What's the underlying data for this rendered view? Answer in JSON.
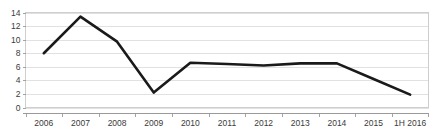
{
  "chart_data": {
    "type": "line",
    "title": "",
    "subtitle": "",
    "xlabel": "",
    "ylabel": "",
    "categories": [
      "2006",
      "2007",
      "2008",
      "2009",
      "2010",
      "2011",
      "2012",
      "2013",
      "2014",
      "2015",
      "1H 2016"
    ],
    "values": [
      8.0,
      13.4,
      9.7,
      2.2,
      6.6,
      6.4,
      6.2,
      6.5,
      6.5,
      4.2,
      1.9
    ],
    "series": [
      {
        "name": "series-1",
        "values": [
          8.0,
          13.4,
          9.7,
          2.2,
          6.6,
          6.4,
          6.2,
          6.5,
          6.5,
          4.2,
          1.9
        ],
        "color": "#1a1a1a"
      }
    ],
    "ylim": [
      0,
      14
    ],
    "ytick_labels": [
      "0",
      "2",
      "4",
      "6",
      "8",
      "10",
      "12",
      "14"
    ],
    "ytick_values": [
      0,
      2,
      4,
      6,
      8,
      10,
      12,
      14
    ],
    "xtick_labels": [
      "2006",
      "2007",
      "2008",
      "2009",
      "2010",
      "2011",
      "2012",
      "2013",
      "2014",
      "2015",
      "1H 2016"
    ],
    "grid": true,
    "grid_axis": "y",
    "legend": false,
    "legend_position": "none",
    "annotations": []
  },
  "style": {
    "line_color": "#1a1a1a",
    "grid_color": "#d9d9d9",
    "axis_color": "#9a9a9a",
    "text_color": "#3a3a3a",
    "background": "#ffffff",
    "line_width": 2.6
  }
}
